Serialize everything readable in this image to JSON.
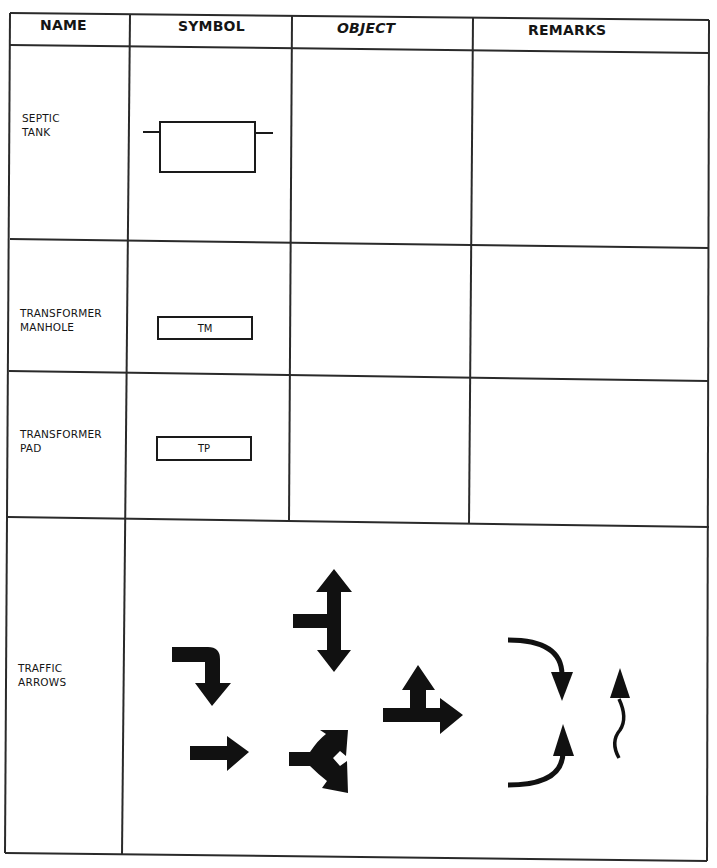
{
  "table": {
    "headers": {
      "name": "NAME",
      "symbol": "SYMBOL",
      "object": "OBJECT",
      "remarks": "REMARKS"
    },
    "rows": [
      {
        "name": "SEPTIC\nTANK",
        "symbol": "septic-tank-symbol",
        "symbol_text": "",
        "object": "",
        "remarks": ""
      },
      {
        "name": "TRANSFORMER\nMANHOLE",
        "symbol": "labeled-box",
        "symbol_text": "TM",
        "object": "",
        "remarks": ""
      },
      {
        "name": "TRANSFORMER\nPAD",
        "symbol": "labeled-box",
        "symbol_text": "TP",
        "object": "",
        "remarks": ""
      },
      {
        "name": "TRAFFIC\nARROWS",
        "symbol": "traffic-arrows-set",
        "symbol_text": "",
        "object": "",
        "remarks": ""
      }
    ]
  },
  "traffic_arrows": [
    "right-turn-down-arrow-icon",
    "straight-right-arrow-icon",
    "two-way-vertical-with-left-branch-arrow-icon",
    "forked-right-arrow-icon",
    "straight-and-up-arrow-icon",
    "curve-down-arrow-icon",
    "curve-up-arrow-icon",
    "wavy-up-arrow-icon"
  ],
  "colors": {
    "ink": "#1a1a1a",
    "paper": "#ffffff"
  }
}
